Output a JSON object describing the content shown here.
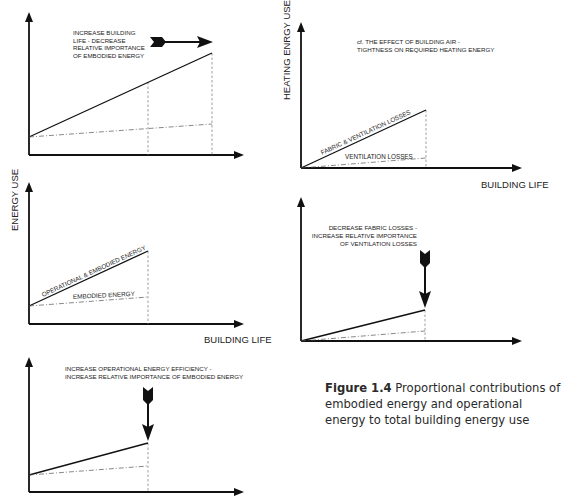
{
  "colors": {
    "ink": "#111111",
    "guide": "#777777",
    "text": "#222222"
  },
  "panels": [
    {
      "id": "top-left",
      "annotation": [
        "INCREASE BUILDING",
        "LIFE - DECREASE",
        "RELATIVE IMPORTANCE",
        "OF EMBODIED ENERGY"
      ],
      "arrow_direction": "right"
    },
    {
      "id": "top-right",
      "y_axis_label": "HEATING ENRGY USE",
      "x_axis_label": "BUILDING LIFE",
      "annotation": [
        "cf. THE EFFECT OF BUILDING AIR -",
        "TIGHTNESS ON REQUIRED HEATING ENERGY"
      ],
      "solid_line_label": "FABRIC & VENTILATION LOSSES",
      "dashed_line_label": "VENTILATION LOSSES"
    },
    {
      "id": "middle-left",
      "y_axis_label": "ENERGY USE",
      "x_axis_label": "BUILDING LIFE",
      "solid_line_label": "OPERATIONAL & EMBODIED ENERGY",
      "dashed_line_label": "EMBODIED ENERGY"
    },
    {
      "id": "middle-right",
      "annotation": [
        "DECREASE FABRIC LOSSES -",
        "INCREASE RELATIVE IMPORTANCE",
        "OF VENTILATION LOSSES"
      ],
      "arrow_direction": "down"
    },
    {
      "id": "bottom-left",
      "annotation": [
        "INCREASE OPERATIONAL ENERGY EFFICIENCY -",
        "INCREASE RELATIVE IMPORTANCE OF EMBODIED ENERGY"
      ],
      "arrow_direction": "down"
    }
  ],
  "caption": {
    "label": "Figure 1.4",
    "text": " Proportional contributions of embodied energy and operational energy to total building energy use"
  }
}
